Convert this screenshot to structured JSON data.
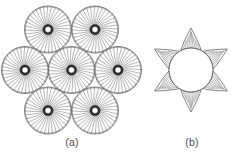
{
  "figure": {
    "background_color": "#ffffff",
    "line_color": "#4d4d4d",
    "hub_color": "#2b2b2b",
    "fill_color": "#ffffff",
    "panels": [
      {
        "id": "a",
        "caption": "(a)",
        "description": "Hexagonal close-packed arrangement of seven spoked circular strands",
        "circle_count": 7,
        "circle_radius": 23.5,
        "spoke_count": 36,
        "hub_outer_radius": 5.2,
        "hub_inner_radius": 3.0,
        "centers": [
          {
            "label": "center",
            "cx": 71.5,
            "cy": 70.0
          },
          {
            "label": "upper-left",
            "cx": 48.0,
            "cy": 29.5
          },
          {
            "label": "upper-right",
            "cx": 95.0,
            "cy": 29.5
          },
          {
            "label": "left",
            "cx": 25.0,
            "cy": 70.0
          },
          {
            "label": "right",
            "cx": 118.0,
            "cy": 70.0
          },
          {
            "label": "lower-left",
            "cx": 48.0,
            "cy": 110.5
          },
          {
            "label": "lower-right",
            "cx": 95.0,
            "cy": 110.5
          }
        ]
      },
      {
        "id": "b",
        "caption": "(b)",
        "description": "Single circular strand with six cusped interstitial voids",
        "center": {
          "cx": 191.0,
          "cy": 70.0
        },
        "circle_radius": 22.0,
        "cusp_count": 6,
        "cusp_height": 20.0,
        "cusp_hatch_lines": 9,
        "cusp_angles_deg": [
          270,
          330,
          30,
          90,
          150,
          210
        ]
      }
    ]
  },
  "chart_data": {
    "type": "diagram",
    "title": "",
    "panels": [
      {
        "label": "(a)",
        "type": "packing",
        "arrangement": "hexagonal",
        "units": 7,
        "unit_type": "spoked-circle",
        "spokes_per_unit": 36
      },
      {
        "label": "(b)",
        "type": "interstitial",
        "arrangement": "hexagonal",
        "units": 1,
        "unit_type": "circle",
        "voids": 6,
        "void_type": "cusped-triangle"
      }
    ]
  }
}
